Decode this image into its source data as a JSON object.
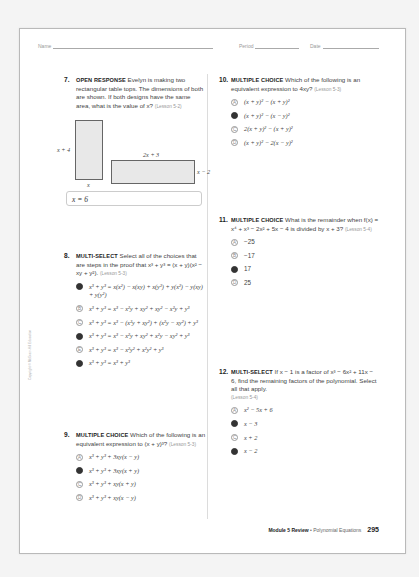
{
  "header": {
    "name_label": "Name",
    "period_label": "Period",
    "date_label": "Date"
  },
  "copyright": "Copyright © McGraw-Hill Education",
  "q7": {
    "number": "7.",
    "type": "OPEN RESPONSE",
    "text": "Evelyn is making two rectangular table tops. The dimensions of both are shown. If both designs have the same area, what is the value of x?",
    "lesson": "(Lesson 5-2)",
    "figure": {
      "rect1_height": "x + 4",
      "rect1_width": "x",
      "rect2_width": "2x + 3",
      "rect2_height": "x − 2"
    },
    "answer": "x = 6"
  },
  "q8": {
    "number": "8.",
    "type": "MULTI-SELECT",
    "text": "Select all of the choices that are steps in the proof that x³ + y³ = (x + y)(x² − xy + y²).",
    "lesson": "(Lesson 5-3)",
    "options": [
      {
        "letter": "A",
        "text": "x³ + y³ = x(x²) − x(xy) + x(y²) + y(x²) − y(xy) + y(y²)",
        "selected": true
      },
      {
        "letter": "B",
        "text": "x³ + y³ = x³ − x²y + xy² + xy² − x²y + y³",
        "selected": false
      },
      {
        "letter": "C",
        "text": "x³ + y³ = x³ − (x²y + xy²) + (x²y − xy²) + y³",
        "selected": false
      },
      {
        "letter": "D",
        "text": "x³ + y³ = x³ − x²y + xy² + x²y − xy² + y³",
        "selected": true
      },
      {
        "letter": "E",
        "text": "x³ + y³ = x³ − x²y² + x²y² + y³",
        "selected": false
      },
      {
        "letter": "F",
        "text": "x³ + y³ = x³ + y³",
        "selected": true
      }
    ]
  },
  "q9": {
    "number": "9.",
    "type": "MULTIPLE CHOICE",
    "text": "Which of the following is an equivalent expression to (x + y)³?",
    "lesson": "(Lesson 5-3)",
    "options": [
      {
        "letter": "A",
        "text": "x³ + y³ + 3xy(x − y)",
        "selected": false
      },
      {
        "letter": "B",
        "text": "x³ + y³ + 3xy(x + y)",
        "selected": true
      },
      {
        "letter": "C",
        "text": "x³ + y³ + xy(x + y)",
        "selected": false
      },
      {
        "letter": "D",
        "text": "x³ + y³ + xy(x − y)",
        "selected": false
      }
    ]
  },
  "q10": {
    "number": "10.",
    "type": "MULTIPLE CHOICE",
    "text": "Which of the following is an equivalent expression to 4xy?",
    "lesson": "(Lesson 5-3)",
    "options": [
      {
        "letter": "A",
        "text": "(x + y)² − (x + y)²",
        "selected": false
      },
      {
        "letter": "B",
        "text": "(x + y)² − (x − y)²",
        "selected": true
      },
      {
        "letter": "C",
        "text": "2(x + y)² − (x + y)²",
        "selected": false
      },
      {
        "letter": "D",
        "text": "(x + y)² − 2(x − y)²",
        "selected": false
      }
    ]
  },
  "q11": {
    "number": "11.",
    "type": "MULTIPLE CHOICE",
    "text": "What is the remainder when f(x) = x⁴ + x³ − 2x² + 5x − 4 is divided by x + 3?",
    "lesson": "(Lesson 5-4)",
    "options": [
      {
        "letter": "A",
        "text": "−25",
        "selected": false
      },
      {
        "letter": "B",
        "text": "−17",
        "selected": false
      },
      {
        "letter": "C",
        "text": "17",
        "selected": true
      },
      {
        "letter": "D",
        "text": "25",
        "selected": false
      }
    ]
  },
  "q12": {
    "number": "12.",
    "type": "MULTI-SELECT",
    "text": "If x − 1 is a factor of x³ − 6x² + 11x − 6, find the remaining factors of the polynomial. Select all that apply.",
    "lesson": "(Lesson 5-4)",
    "options": [
      {
        "letter": "A",
        "text": "x² − 5x + 6",
        "selected": false
      },
      {
        "letter": "B",
        "text": "x − 3",
        "selected": true
      },
      {
        "letter": "C",
        "text": "x + 2",
        "selected": false
      },
      {
        "letter": "D",
        "text": "x − 2",
        "selected": true
      }
    ]
  },
  "footer": {
    "module": "Module 5 Review",
    "separator": " • ",
    "topic": "Polynomial Equations",
    "page_number": "295"
  }
}
